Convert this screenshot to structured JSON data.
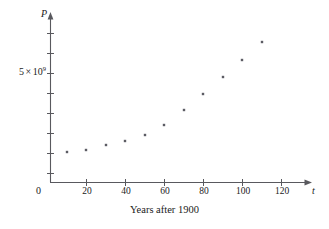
{
  "chart_data": {
    "type": "scatter",
    "title": "",
    "caption": "Years after 1900",
    "xlabel": "t",
    "ylabel": "P",
    "xlim": [
      0,
      128
    ],
    "ylim": [
      0,
      9200000000
    ],
    "grid": false,
    "legend": "none",
    "x_ticks": [
      {
        "value": 0,
        "label": "0"
      },
      {
        "value": 20,
        "label": "20"
      },
      {
        "value": 40,
        "label": "40"
      },
      {
        "value": 60,
        "label": "60"
      },
      {
        "value": 80,
        "label": "80"
      },
      {
        "value": 100,
        "label": "100"
      },
      {
        "value": 120,
        "label": "120"
      }
    ],
    "y_ticks": [
      {
        "value": 1000000000,
        "label": ""
      },
      {
        "value": 2000000000,
        "label": ""
      },
      {
        "value": 3000000000,
        "label": ""
      },
      {
        "value": 4000000000,
        "label": ""
      },
      {
        "value": 5000000000,
        "label": "5 × 10⁹"
      },
      {
        "value": 6000000000,
        "label": ""
      },
      {
        "value": 7000000000,
        "label": ""
      },
      {
        "value": 8000000000,
        "label": ""
      }
    ],
    "y_tick_label_main": {
      "mantissa": "5",
      "times": "×",
      "base": "10",
      "exponent": "9"
    },
    "x": [
      10,
      20,
      30,
      40,
      50,
      60,
      70,
      80,
      90,
      100,
      110
    ],
    "y": [
      1650000000,
      1750000000,
      1860000000,
      2070000000,
      2300000000,
      2560000000,
      3040000000,
      3710000000,
      4450000000,
      5280000000,
      6080000000
    ],
    "points": [
      {
        "t": 10,
        "px": 67,
        "py": 152
      },
      {
        "t": 20,
        "px": 86,
        "py": 150
      },
      {
        "t": 30,
        "px": 106,
        "py": 145
      },
      {
        "t": 40,
        "px": 125,
        "py": 141
      },
      {
        "t": 50,
        "px": 145,
        "py": 135
      },
      {
        "t": 60,
        "px": 164,
        "py": 125
      },
      {
        "t": 70,
        "px": 184,
        "py": 110
      },
      {
        "t": 80,
        "px": 203,
        "py": 94
      },
      {
        "t": 90,
        "px": 223,
        "py": 77
      },
      {
        "t": 100,
        "px": 242,
        "py": 60
      },
      {
        "t": 110,
        "px": 262,
        "py": 42
      }
    ]
  },
  "axes": {
    "origin_label": "0",
    "x_variable": "t",
    "y_variable": "P"
  },
  "colors": {
    "axis": "#59595e",
    "point": "#5c5c63",
    "text": "#1a1a1a",
    "background": "#ffffff"
  }
}
